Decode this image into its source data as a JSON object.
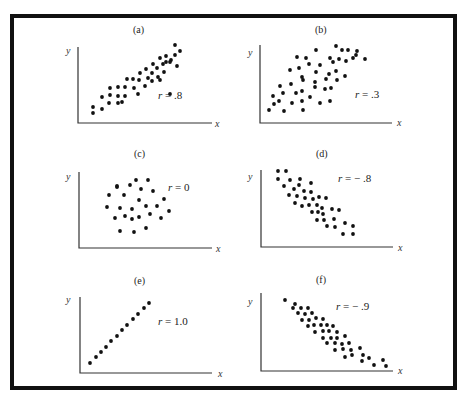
{
  "chart_data": [
    {
      "type": "scatter",
      "panel": "(a)",
      "annotation": "r = .8",
      "r": 0.8,
      "xlabel": "x",
      "ylabel": "y",
      "grid": false,
      "points": [
        [
          93,
          113
        ],
        [
          93,
          107
        ],
        [
          102,
          109
        ],
        [
          102,
          97
        ],
        [
          109,
          103
        ],
        [
          110,
          95
        ],
        [
          118,
          96
        ],
        [
          118,
          103
        ],
        [
          118,
          87
        ],
        [
          110,
          88
        ],
        [
          122,
          102
        ],
        [
          125,
          96
        ],
        [
          125,
          87
        ],
        [
          127,
          79
        ],
        [
          133,
          79
        ],
        [
          134,
          88
        ],
        [
          138,
          94
        ],
        [
          139,
          80
        ],
        [
          140,
          73
        ],
        [
          146,
          69
        ],
        [
          145,
          86
        ],
        [
          148,
          78
        ],
        [
          152,
          81
        ],
        [
          152,
          73
        ],
        [
          153,
          64
        ],
        [
          157,
          68
        ],
        [
          158,
          77
        ],
        [
          160,
          58
        ],
        [
          163,
          64
        ],
        [
          164,
          72
        ],
        [
          166,
          56
        ],
        [
          166,
          62
        ],
        [
          170,
          94
        ],
        [
          171,
          60
        ],
        [
          175,
          55
        ],
        [
          180,
          51
        ],
        [
          175,
          45
        ],
        [
          170,
          62
        ],
        [
          177,
          66
        ],
        [
          160,
          80
        ]
      ]
    },
    {
      "type": "scatter",
      "panel": "(b)",
      "annotation": "r = .3",
      "r": 0.3,
      "xlabel": "x",
      "ylabel": "y",
      "grid": false,
      "points": [
        [
          269,
          110
        ],
        [
          284,
          111
        ],
        [
          303,
          110
        ],
        [
          274,
          104
        ],
        [
          279,
          101
        ],
        [
          292,
          103
        ],
        [
          302,
          101
        ],
        [
          273,
          96
        ],
        [
          283,
          93
        ],
        [
          296,
          93
        ],
        [
          302,
          91
        ],
        [
          310,
          97
        ],
        [
          320,
          103
        ],
        [
          330,
          101
        ],
        [
          315,
          87
        ],
        [
          325,
          89
        ],
        [
          331,
          88
        ],
        [
          280,
          86
        ],
        [
          291,
          84
        ],
        [
          303,
          80
        ],
        [
          315,
          82
        ],
        [
          326,
          79
        ],
        [
          337,
          80
        ],
        [
          290,
          70
        ],
        [
          302,
          77
        ],
        [
          316,
          72
        ],
        [
          329,
          74
        ],
        [
          336,
          71
        ],
        [
          345,
          76
        ],
        [
          299,
          68
        ],
        [
          309,
          64
        ],
        [
          320,
          65
        ],
        [
          330,
          58
        ],
        [
          339,
          59
        ],
        [
          342,
          50
        ],
        [
          297,
          57
        ],
        [
          306,
          58
        ],
        [
          316,
          50
        ],
        [
          333,
          62
        ],
        [
          346,
          61
        ],
        [
          353,
          58
        ],
        [
          356,
          55
        ],
        [
          365,
          59
        ],
        [
          336,
          46
        ],
        [
          348,
          50
        ],
        [
          357,
          51
        ]
      ]
    },
    {
      "type": "scatter",
      "panel": "(c)",
      "annotation": "r = 0",
      "r": 0.0,
      "xlabel": "x",
      "ylabel": "y",
      "grid": false,
      "points": [
        [
          136,
          180
        ],
        [
          148,
          180
        ],
        [
          117,
          187
        ],
        [
          130,
          185
        ],
        [
          141,
          189
        ],
        [
          153,
          191
        ],
        [
          109,
          195
        ],
        [
          124,
          195
        ],
        [
          164,
          199
        ],
        [
          139,
          200
        ],
        [
          107,
          207
        ],
        [
          120,
          208
        ],
        [
          132,
          209
        ],
        [
          146,
          206
        ],
        [
          157,
          206
        ],
        [
          169,
          211
        ],
        [
          115,
          218
        ],
        [
          125,
          216
        ],
        [
          132,
          219
        ],
        [
          139,
          217
        ],
        [
          150,
          214
        ],
        [
          161,
          218
        ],
        [
          146,
          228
        ],
        [
          120,
          231
        ],
        [
          134,
          232
        ],
        [
          117,
          186
        ]
      ]
    },
    {
      "type": "scatter",
      "panel": "(d)",
      "annotation": "r = −.8",
      "r": -0.8,
      "xlabel": "x",
      "ylabel": "y",
      "grid": false,
      "points": [
        [
          278,
          171
        ],
        [
          286,
          171
        ],
        [
          278,
          179
        ],
        [
          290,
          180
        ],
        [
          300,
          179
        ],
        [
          311,
          183
        ],
        [
          284,
          186
        ],
        [
          294,
          189
        ],
        [
          299,
          185
        ],
        [
          304,
          191
        ],
        [
          311,
          192
        ],
        [
          289,
          195
        ],
        [
          297,
          196
        ],
        [
          305,
          198
        ],
        [
          313,
          199
        ],
        [
          319,
          197
        ],
        [
          326,
          198
        ],
        [
          295,
          203
        ],
        [
          302,
          206
        ],
        [
          309,
          205
        ],
        [
          317,
          205
        ],
        [
          322,
          208
        ],
        [
          332,
          209
        ],
        [
          312,
          212
        ],
        [
          318,
          212
        ],
        [
          323,
          214
        ],
        [
          339,
          210
        ],
        [
          317,
          220
        ],
        [
          324,
          220
        ],
        [
          334,
          219
        ],
        [
          345,
          223
        ],
        [
          327,
          226
        ],
        [
          335,
          227
        ],
        [
          353,
          226
        ],
        [
          343,
          234
        ],
        [
          353,
          234
        ]
      ]
    },
    {
      "type": "scatter",
      "panel": "(e)",
      "annotation": "r = 1.0",
      "r": 1.0,
      "xlabel": "x",
      "ylabel": "y",
      "grid": false,
      "points": [
        [
          90,
          363
        ],
        [
          96,
          357
        ],
        [
          101,
          352
        ],
        [
          106,
          347
        ],
        [
          111,
          341
        ],
        [
          117,
          336
        ],
        [
          122,
          330
        ],
        [
          127,
          325
        ],
        [
          133,
          319
        ],
        [
          138,
          314
        ],
        [
          144,
          308
        ],
        [
          149,
          303
        ]
      ]
    },
    {
      "type": "scatter",
      "panel": "(f)",
      "annotation": "r = −.9",
      "r": -0.9,
      "xlabel": "x",
      "ylabel": "y",
      "grid": false,
      "points": [
        [
          285,
          300
        ],
        [
          295,
          304
        ],
        [
          293,
          308
        ],
        [
          301,
          308
        ],
        [
          308,
          308
        ],
        [
          298,
          313
        ],
        [
          305,
          314
        ],
        [
          312,
          313
        ],
        [
          302,
          320
        ],
        [
          309,
          320
        ],
        [
          316,
          318
        ],
        [
          323,
          319
        ],
        [
          308,
          326
        ],
        [
          314,
          325
        ],
        [
          321,
          325
        ],
        [
          327,
          325
        ],
        [
          333,
          326
        ],
        [
          315,
          332
        ],
        [
          323,
          331
        ],
        [
          329,
          331
        ],
        [
          337,
          332
        ],
        [
          323,
          338
        ],
        [
          331,
          338
        ],
        [
          337,
          338
        ],
        [
          345,
          336
        ],
        [
          327,
          343
        ],
        [
          335,
          343
        ],
        [
          342,
          344
        ],
        [
          349,
          343
        ],
        [
          335,
          350
        ],
        [
          343,
          349
        ],
        [
          351,
          350
        ],
        [
          360,
          348
        ],
        [
          345,
          357
        ],
        [
          352,
          355
        ],
        [
          363,
          355
        ],
        [
          362,
          361
        ],
        [
          369,
          358
        ],
        [
          374,
          365
        ],
        [
          383,
          360
        ],
        [
          386,
          366
        ]
      ]
    }
  ],
  "panels": [
    {
      "id": "a",
      "label": "(a)",
      "r_prefix": "r",
      "r_value": " = .8"
    },
    {
      "id": "b",
      "label": "(b)",
      "r_prefix": "r",
      "r_value": " = .3"
    },
    {
      "id": "c",
      "label": "(c)",
      "r_prefix": "r",
      "r_value": " = 0"
    },
    {
      "id": "d",
      "label": "(d)",
      "r_prefix": "r",
      "r_value": " = − .8"
    },
    {
      "id": "e",
      "label": "(e)",
      "r_prefix": "r",
      "r_value": " = 1.0"
    },
    {
      "id": "f",
      "label": "(f)",
      "r_prefix": "r",
      "r_value": " = − .9"
    }
  ],
  "axes": {
    "x_label": "x",
    "y_label": "y"
  },
  "colors": {
    "ink": "#111111",
    "axis": "#333333",
    "background": "#ffffff"
  }
}
